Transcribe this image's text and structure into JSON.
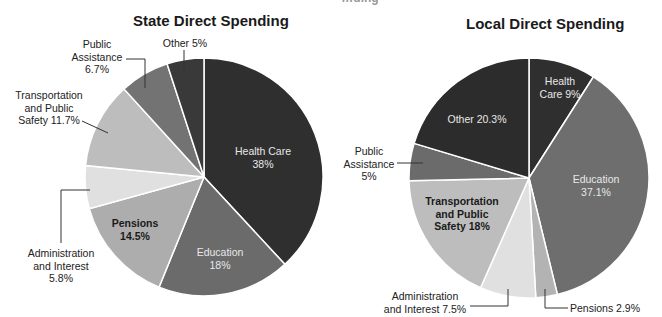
{
  "page": {
    "cut_off_title_fragment": "…ding"
  },
  "chart_data": [
    {
      "type": "pie",
      "title": "State Direct Spending",
      "start_angle": "12 o'clock",
      "direction": "clockwise",
      "categories": [
        "Health Care",
        "Education",
        "Pensions",
        "Administration and Interest",
        "Transportation and Public Safety",
        "Public Assistance",
        "Other"
      ],
      "values": [
        38,
        18,
        14.5,
        5.8,
        11.7,
        6.7,
        5
      ],
      "unit": "%",
      "colors": [
        "#2f2f2f",
        "#6b6b6b",
        "#adadad",
        "#e0e0e0",
        "#bdbdbd",
        "#737373",
        "#393939"
      ],
      "labels": {
        "health_care": [
          "Health Care",
          "38%"
        ],
        "education": [
          "Education",
          "18%"
        ],
        "pensions": [
          "Pensions",
          "14.5%"
        ],
        "admin": [
          "Administration",
          "and Interest",
          "5.8%"
        ],
        "transport": [
          "Transportation",
          "and Public",
          "Safety 11.7%"
        ],
        "public_assistance": [
          "Public",
          "Assistance",
          "6.7%"
        ],
        "other": [
          "Other 5%"
        ]
      }
    },
    {
      "type": "pie",
      "title": "Local Direct Spending",
      "start_angle": "12 o'clock",
      "direction": "clockwise",
      "categories": [
        "Health Care",
        "Education",
        "Pensions",
        "Administration and Interest",
        "Transportation and Public Safety",
        "Public Assistance",
        "Other"
      ],
      "values": [
        9,
        37.1,
        2.9,
        7.5,
        18,
        5,
        20.3
      ],
      "unit": "%",
      "colors": [
        "#2f2f2f",
        "#6e6e6e",
        "#b3b3b3",
        "#e0e0e0",
        "#bdbdbd",
        "#6b6b6b",
        "#2c2c2c"
      ],
      "labels": {
        "health_care": [
          "Health",
          "Care 9%"
        ],
        "education": [
          "Education",
          "37.1%"
        ],
        "pensions": [
          "Pensions 2.9%"
        ],
        "admin": [
          "Administration",
          "and Interest 7.5%"
        ],
        "transport": [
          "Transportation",
          "and Public",
          "Safety 18%"
        ],
        "public_assistance": [
          "Public",
          "Assistance",
          "5%"
        ],
        "other": [
          "Other 20.3%"
        ]
      }
    }
  ]
}
